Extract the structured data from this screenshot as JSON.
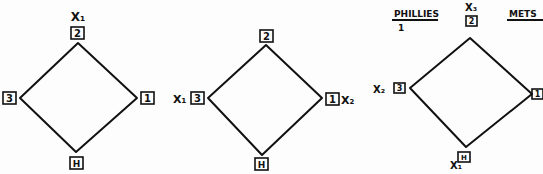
{
  "diagrams": [
    {
      "bases": {
        "second": "2",
        "third": "3",
        "first": "1",
        "home": "H"
      },
      "markers": {
        "top": "X1"
      },
      "markers_display": {
        "top": "X₁"
      }
    },
    {
      "bases": {
        "second": "2",
        "third": "3",
        "first": "1",
        "home": "H"
      },
      "markers_display": {
        "left": "X₁",
        "right": "X₂"
      }
    },
    {
      "bases": {
        "second": "2",
        "third": "3",
        "first": "1",
        "home": "H"
      },
      "markers_display": {
        "top": "X₃",
        "left": "X₂",
        "bottom": "X₁"
      },
      "scoreboard": {
        "team_left": "PHILLIES",
        "team_left_score": "1",
        "team_right": "METS"
      }
    }
  ]
}
